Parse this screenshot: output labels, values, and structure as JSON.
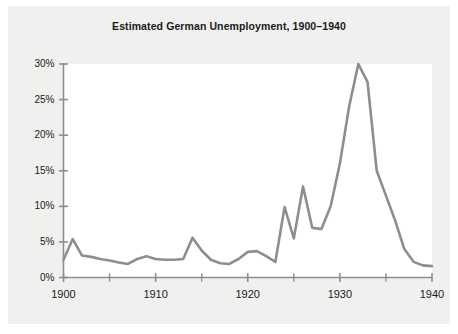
{
  "chart_data": {
    "type": "line",
    "title": "Estimated German Unemployment, 1900–1940",
    "xlabel": "",
    "ylabel": "",
    "xlim": [
      1900,
      1940
    ],
    "ylim": [
      0,
      30
    ],
    "grid": false,
    "legend": null,
    "line_color": "#8e8e8e",
    "plot_background": "#ffffff",
    "figure_background": "#f0f0ef",
    "x_major_ticks": [
      1900,
      1910,
      1920,
      1930,
      1940
    ],
    "x_major_tick_labels": [
      "1900",
      "1910",
      "1920",
      "1930",
      "1940"
    ],
    "x_minor_ticks": [
      1905,
      1915,
      1925,
      1935
    ],
    "y_ticks": [
      0,
      5,
      10,
      15,
      20,
      25,
      30
    ],
    "y_tick_labels": [
      "0%",
      "5%",
      "10%",
      "15%",
      "20%",
      "25%",
      "30%"
    ],
    "series": [
      {
        "name": "Estimated German unemployment rate",
        "unit": "percent",
        "x": [
          1900,
          1901,
          1902,
          1903,
          1904,
          1905,
          1906,
          1907,
          1908,
          1909,
          1910,
          1911,
          1912,
          1913,
          1914,
          1915,
          1916,
          1917,
          1918,
          1919,
          1920,
          1921,
          1922,
          1923,
          1924,
          1925,
          1926,
          1927,
          1928,
          1929,
          1930,
          1931,
          1932,
          1933,
          1934,
          1935,
          1936,
          1937,
          1938,
          1939,
          1940
        ],
        "values": [
          2.5,
          5.4,
          3.1,
          2.9,
          2.6,
          2.4,
          2.1,
          1.9,
          2.6,
          3.0,
          2.6,
          2.5,
          2.5,
          2.6,
          5.6,
          3.8,
          2.5,
          2.0,
          1.9,
          2.6,
          3.6,
          3.7,
          3.0,
          2.2,
          9.9,
          5.5,
          12.8,
          7.0,
          6.8,
          10.0,
          16.0,
          24.0,
          30.0,
          27.5,
          15.0,
          11.5,
          8.0,
          4.0,
          2.2,
          1.7,
          1.6
        ]
      }
    ],
    "peaks": [
      {
        "year": 1901,
        "value": 5.4
      },
      {
        "year": 1914,
        "value": 5.6
      },
      {
        "year": 1924,
        "value": 9.9
      },
      {
        "year": 1926,
        "value": 12.8
      },
      {
        "year": 1932,
        "value": 30.0
      }
    ]
  }
}
